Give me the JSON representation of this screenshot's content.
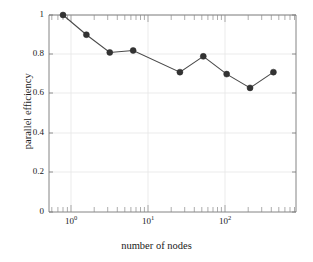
{
  "chart_data": {
    "type": "line",
    "title": "",
    "xlabel": "number of nodes",
    "ylabel": "parallel efficiency",
    "xscale": "log",
    "yscale": "linear",
    "xlim": [
      0.66,
      1000
    ],
    "ylim": [
      0,
      1
    ],
    "grid": true,
    "legend": null,
    "marker": "filled-circle",
    "line_color": "#4a4a4a",
    "marker_color": "#333333",
    "grid_color": "#e6e6e6",
    "axis_color": "#777777",
    "x": [
      1,
      2,
      4,
      8,
      32,
      64,
      128,
      256,
      512
    ],
    "values": [
      1.0,
      0.9,
      0.81,
      0.82,
      0.71,
      0.79,
      0.7,
      0.63,
      0.71
    ],
    "series": [
      {
        "name": "parallel efficiency",
        "x": [
          1,
          2,
          4,
          8,
          32,
          64,
          128,
          256,
          512
        ],
        "values": [
          1.0,
          0.9,
          0.81,
          0.82,
          0.71,
          0.79,
          0.7,
          0.63,
          0.71
        ]
      }
    ],
    "yticks": [
      0,
      0.2,
      0.4,
      0.6,
      0.8,
      1
    ],
    "ytick_labels": [
      "0",
      "0.2",
      "0.4",
      "0.6",
      "0.8",
      "1"
    ],
    "xticks": [
      1,
      10,
      100
    ],
    "xtick_labels": [
      "10",
      "10",
      "10"
    ],
    "xtick_exponents": [
      "0",
      "1",
      "2"
    ]
  }
}
